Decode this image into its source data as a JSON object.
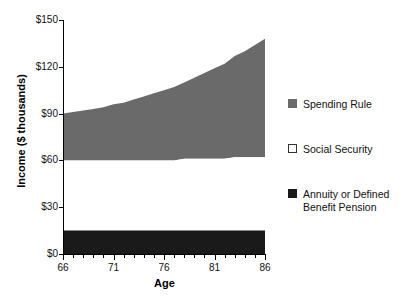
{
  "chart_data": {
    "type": "area",
    "title": "",
    "subtitle": "",
    "xlabel": "Age",
    "ylabel": "Income ($ thousands)",
    "xlim": [
      66,
      86
    ],
    "ylim": [
      0,
      150
    ],
    "x": [
      66,
      67,
      68,
      69,
      70,
      71,
      72,
      73,
      74,
      75,
      76,
      77,
      78,
      79,
      80,
      81,
      82,
      83,
      84,
      85,
      86
    ],
    "grid": false,
    "stacked": true,
    "legend_position": "right",
    "series": [
      {
        "name": "Annuity or Defined Benefit Pension",
        "color": "#1a1a1a",
        "values": [
          15,
          15,
          15,
          15,
          15,
          15,
          15,
          15,
          15,
          15,
          15,
          15,
          15,
          15,
          15,
          15,
          15,
          15,
          15,
          15,
          15
        ]
      },
      {
        "name": "Social Security",
        "color": "#ffffff",
        "values": [
          45,
          45,
          45,
          45,
          45,
          45,
          45,
          45,
          45,
          45,
          45,
          45,
          46,
          46,
          46,
          46,
          46,
          47,
          47,
          47,
          47
        ]
      },
      {
        "name": "Spending Rule",
        "color": "#6a6a6a",
        "values": [
          30,
          31,
          32,
          33,
          34,
          36,
          37,
          39,
          41,
          43,
          45,
          47,
          49,
          52,
          55,
          58,
          61,
          65,
          68,
          72,
          76
        ]
      }
    ],
    "cumulative_tops": {
      "annuity_top": [
        15,
        15,
        15,
        15,
        15,
        15,
        15,
        15,
        15,
        15,
        15,
        15,
        15,
        15,
        15,
        15,
        15,
        15,
        15,
        15,
        15
      ],
      "social_security_top": [
        60,
        60,
        60,
        60,
        60,
        60,
        60,
        60,
        60,
        60,
        60,
        60,
        61,
        61,
        61,
        61,
        61,
        62,
        62,
        62,
        62
      ],
      "spending_rule_top": [
        90,
        91,
        92,
        93,
        94,
        96,
        97,
        99,
        101,
        103,
        105,
        107,
        110,
        113,
        116,
        119,
        122,
        127,
        130,
        134,
        138
      ]
    },
    "y_ticks": [
      {
        "value": 0,
        "label": "$0"
      },
      {
        "value": 30,
        "label": "$30"
      },
      {
        "value": 60,
        "label": "$60"
      },
      {
        "value": 90,
        "label": "$90"
      },
      {
        "value": 120,
        "label": "$120"
      },
      {
        "value": 150,
        "label": "$150"
      }
    ],
    "x_ticks_major": [
      {
        "value": 66,
        "label": "66"
      },
      {
        "value": 71,
        "label": "71"
      },
      {
        "value": 76,
        "label": "76"
      },
      {
        "value": 81,
        "label": "81"
      },
      {
        "value": 86,
        "label": "86"
      }
    ],
    "x_ticks_minor": [
      67,
      68,
      69,
      70,
      72,
      73,
      74,
      75,
      77,
      78,
      79,
      80,
      82,
      83,
      84,
      85
    ],
    "legend": [
      {
        "label": "Spending Rule",
        "color": "#6a6a6a",
        "border": "#6a6a6a"
      },
      {
        "label": "Social Security",
        "color": "#ffffff",
        "border": "#333333"
      },
      {
        "label": "Annuity or Defined\nBenefit Pension",
        "color": "#1a1a1a",
        "border": "#1a1a1a"
      }
    ]
  }
}
